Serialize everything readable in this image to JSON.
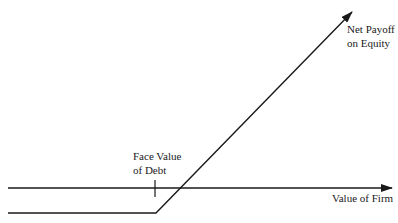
{
  "diagram": {
    "title": "",
    "colors": {
      "line": "#1a1a1a",
      "background": "#ffffff"
    },
    "labels": {
      "net_payoff": {
        "line1": "Net Payoff",
        "line2": "on Equity"
      },
      "face_value": {
        "line1": "Face Value",
        "line2": "of Debt"
      },
      "x_axis": "Value of Firm"
    },
    "geometry": {
      "x_axis": {
        "x1": 8,
        "y": 188,
        "x2": 393
      },
      "face_value_tick": {
        "x": 155,
        "y1": 180,
        "y2": 197
      },
      "payoff_line": {
        "points": [
          [
            8,
            213
          ],
          [
            156,
            213
          ],
          [
            353,
            11
          ]
        ]
      }
    }
  }
}
